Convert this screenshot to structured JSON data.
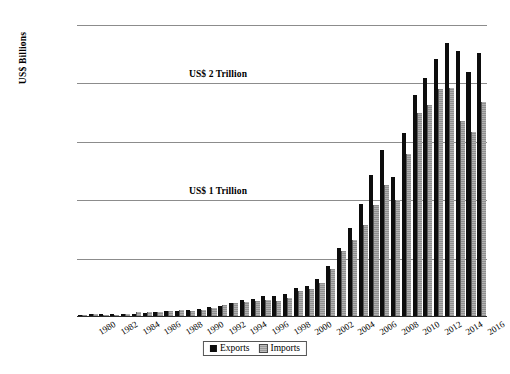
{
  "chart_data": {
    "type": "bar",
    "title": "",
    "xlabel": "",
    "ylabel": "US$ Billions",
    "ylim": [
      0,
      2500
    ],
    "yticks": [
      0,
      500,
      1000,
      1500,
      2000,
      2500
    ],
    "ytick_labels": [
      "$0",
      "$500",
      "$1,000",
      "$1,500",
      "$2,000",
      "$2,500"
    ],
    "grid": true,
    "legend_position": "bottom",
    "categories": [
      "1980",
      "1981",
      "1982",
      "1983",
      "1984",
      "1985",
      "1986",
      "1987",
      "1988",
      "1989",
      "1990",
      "1991",
      "1992",
      "1993",
      "1994",
      "1995",
      "1996",
      "1997",
      "1998",
      "1999",
      "2000",
      "2001",
      "2002",
      "2003",
      "2004",
      "2005",
      "2006",
      "2007",
      "2008",
      "2009",
      "2010",
      "2011",
      "2012",
      "2013",
      "2014",
      "2015",
      "2016",
      "2017"
    ],
    "xtick_labels": [
      "1980",
      "1982",
      "1984",
      "1986",
      "1988",
      "1990",
      "1992",
      "1994",
      "1996",
      "1998",
      "2000",
      "2002",
      "2004",
      "2006",
      "2008",
      "2010",
      "2012",
      "2014",
      "2016"
    ],
    "series": [
      {
        "name": "Exports",
        "color": "#0d0d0d",
        "values": [
          18,
          22,
          22,
          22,
          26,
          27,
          31,
          39,
          48,
          53,
          62,
          72,
          85,
          92,
          121,
          149,
          151,
          183,
          184,
          195,
          249,
          266,
          326,
          438,
          593,
          762,
          969,
          1218,
          1431,
          1202,
          1578,
          1898,
          2049,
          2209,
          2342,
          2275,
          2098,
          2263
        ]
      },
      {
        "name": "Imports",
        "color": "#8f8f8f",
        "values": [
          20,
          22,
          19,
          21,
          27,
          42,
          43,
          43,
          55,
          59,
          53,
          64,
          81,
          104,
          116,
          132,
          139,
          142,
          140,
          166,
          225,
          244,
          295,
          413,
          561,
          660,
          791,
          956,
          1132,
          1006,
          1396,
          1743,
          1818,
          1950,
          1959,
          1682,
          1588,
          1844
        ]
      }
    ],
    "annotations": [
      {
        "text": "US$ 2 Trillion",
        "value": 2000
      },
      {
        "text": "US$ 1 Trillion",
        "value": 1000
      }
    ]
  },
  "legend": {
    "items": [
      {
        "label": "Exports"
      },
      {
        "label": "Imports"
      }
    ]
  }
}
